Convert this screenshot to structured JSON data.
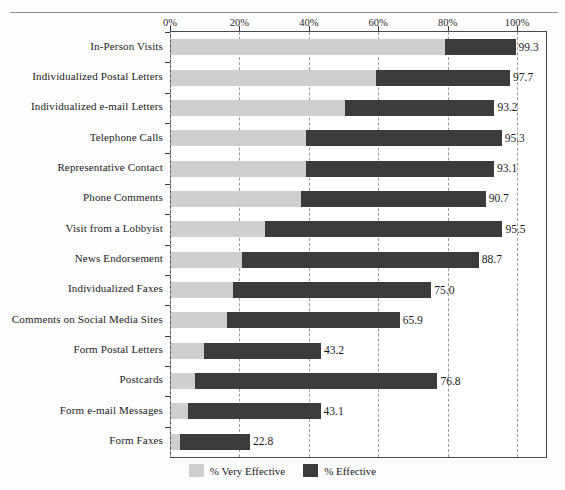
{
  "chart_data": {
    "type": "bar",
    "orientation": "horizontal",
    "stacked": true,
    "title": "",
    "xlabel": "",
    "ylabel": "",
    "xlim": [
      0,
      100
    ],
    "xticks": [
      "0%",
      "20%",
      "40%",
      "60%",
      "80%",
      "100%"
    ],
    "xtick_values": [
      0,
      20,
      40,
      60,
      80,
      100
    ],
    "grid": true,
    "legend_position": "bottom",
    "categories": [
      "In-Person Visits",
      "Individualized Postal Letters",
      "Individualized e-mail Letters",
      "Telephone Calls",
      "Representative Contact",
      "Phone Comments",
      "Visit from a Lobbyist",
      "News Endorsement",
      "Individualized Faxes",
      "Comments on Social Media Sites",
      "Form Postal Letters",
      "Postcards",
      "Form e-mail Messages",
      "Form Faxes"
    ],
    "series": [
      {
        "name": "% Very Effective",
        "color": "#cfcfcf",
        "values": [
          79.0,
          59.0,
          50.0,
          39.0,
          39.0,
          37.5,
          27.0,
          20.5,
          18.0,
          16.0,
          9.5,
          7.0,
          5.0,
          2.5
        ]
      },
      {
        "name": "% Effective",
        "color": "#3b3b3b",
        "values": [
          20.3,
          38.7,
          43.2,
          56.3,
          54.1,
          53.2,
          68.5,
          68.2,
          57.0,
          49.9,
          33.7,
          69.8,
          38.1,
          20.3
        ]
      }
    ],
    "totals": [
      99.3,
      97.7,
      93.2,
      95.3,
      93.1,
      90.7,
      95.5,
      88.7,
      75.0,
      65.9,
      43.2,
      76.8,
      43.1,
      22.8
    ],
    "data_labels": [
      "99.3",
      "97.7",
      "93.2",
      "95.3",
      "93.1",
      "90.7",
      "95.5",
      "88.7",
      "75.0",
      "65.9",
      "43.2",
      "76.8",
      "43.1",
      "22.8"
    ]
  },
  "legend": {
    "items": [
      {
        "label": "% Very Effective",
        "swatch": "light-gray-swatch"
      },
      {
        "label": "% Effective",
        "swatch": "dark-gray-swatch"
      }
    ]
  }
}
